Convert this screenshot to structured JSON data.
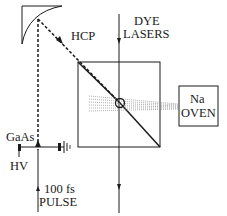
{
  "labels": {
    "hcp": "HCP",
    "dye_lasers_line1": "DYE",
    "dye_lasers_line2": "LASERS",
    "na_oven_line1": "Na",
    "na_oven_line2": "OVEN",
    "gaas": "GaAs",
    "hv": "HV",
    "pulse_line1": "100 fs",
    "pulse_line2": "PULSE"
  },
  "colors": {
    "ink": "#1a1a1a",
    "background": "#ffffff",
    "dots": "#9a9a9a"
  }
}
